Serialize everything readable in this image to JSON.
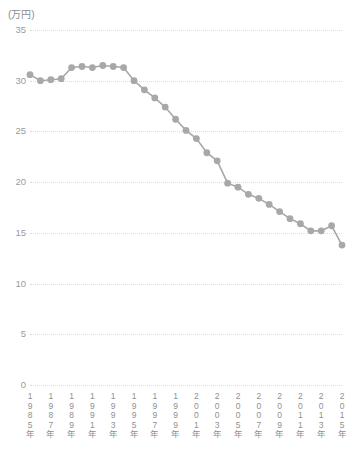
{
  "chart_data": {
    "type": "line",
    "title": "",
    "subtitle": "",
    "unit_label": "(万円)",
    "xlabel": "",
    "ylabel": "",
    "ylim": [
      0,
      35
    ],
    "yticks": [
      0,
      5,
      10,
      15,
      20,
      25,
      30,
      35
    ],
    "grid": true,
    "legend": null,
    "x_tick_labels": [
      "1985年",
      "1987年",
      "1989年",
      "1991年",
      "1993年",
      "1995年",
      "1997年",
      "1999年",
      "2001年",
      "2003年",
      "2005年",
      "2007年",
      "2009年",
      "2011年",
      "2013年",
      "2015年"
    ],
    "x_tick_values": [
      1985,
      1987,
      1989,
      1991,
      1993,
      1995,
      1997,
      1999,
      2001,
      2003,
      2005,
      2007,
      2009,
      2011,
      2013,
      2015
    ],
    "xlim": [
      1985,
      2015
    ],
    "series": [
      {
        "name": "",
        "color": "#a8a8a8",
        "x": [
          1985,
          1986,
          1987,
          1988,
          1989,
          1990,
          1991,
          1992,
          1993,
          1994,
          1995,
          1996,
          1997,
          1998,
          1999,
          2000,
          2001,
          2002,
          2003,
          2004,
          2005,
          2006,
          2007,
          2008,
          2009,
          2010,
          2011,
          2012,
          2013,
          2014,
          2015
        ],
        "values": [
          30.6,
          30.0,
          30.1,
          30.2,
          31.3,
          31.4,
          31.3,
          31.5,
          31.4,
          31.3,
          30.0,
          29.1,
          28.3,
          27.4,
          26.2,
          25.1,
          24.3,
          22.9,
          22.1,
          19.9,
          19.5,
          18.8,
          18.4,
          17.8,
          17.1,
          16.4,
          15.9,
          15.2,
          15.2,
          15.7,
          13.8
        ]
      }
    ]
  }
}
